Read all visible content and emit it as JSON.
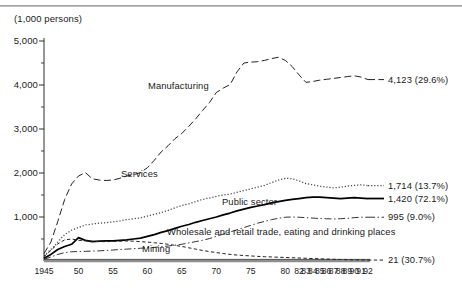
{
  "figure": {
    "unit_note": "(1,000 persons)"
  },
  "chart_data": {
    "type": "line",
    "title": "",
    "subtitle": "",
    "xlabel": "",
    "ylabel": "(1,000 persons)",
    "ylim": [
      0,
      5000
    ],
    "xlim": [
      1945,
      1992
    ],
    "grid": false,
    "legend": "inline-annotations",
    "y_ticks": [
      {
        "value": 5000,
        "label": "5,000"
      },
      {
        "value": 4000,
        "label": "4,000"
      },
      {
        "value": 3000,
        "label": "3,000"
      },
      {
        "value": 2000,
        "label": "2,000"
      },
      {
        "value": 1000,
        "label": "1,000"
      }
    ],
    "y_minor_ticks": [
      4500,
      3500,
      2500,
      1500,
      500
    ],
    "x_ticks": [
      {
        "value": 1945,
        "label": "1945"
      },
      {
        "value": 1950,
        "label": "50"
      },
      {
        "value": 1955,
        "label": "55"
      },
      {
        "value": 1960,
        "label": "60"
      },
      {
        "value": 1965,
        "label": "65"
      },
      {
        "value": 1970,
        "label": "70"
      },
      {
        "value": 1975,
        "label": "75"
      },
      {
        "value": 1980,
        "label": "80"
      },
      {
        "value": 1982,
        "label": "82"
      },
      {
        "value": 1983,
        "label": "83"
      },
      {
        "value": 1984,
        "label": "84"
      },
      {
        "value": 1985,
        "label": "85"
      },
      {
        "value": 1986,
        "label": "86"
      },
      {
        "value": 1987,
        "label": "87"
      },
      {
        "value": 1988,
        "label": "88"
      },
      {
        "value": 1989,
        "label": "89"
      },
      {
        "value": 1990,
        "label": "90"
      },
      {
        "value": 1991,
        "label": "91"
      },
      {
        "value": 1992,
        "label": "92"
      }
    ],
    "series": [
      {
        "name": "Manufacturing",
        "label": "Manufacturing",
        "end_label": "4,123 (29.6%)",
        "end_value": 4123,
        "end_percent": "29.6%",
        "style": "dashed",
        "color": "#222222",
        "x": [
          1945,
          1946,
          1947,
          1948,
          1949,
          1950,
          1951,
          1952,
          1953,
          1954,
          1955,
          1956,
          1957,
          1958,
          1959,
          1960,
          1961,
          1962,
          1963,
          1964,
          1965,
          1966,
          1967,
          1968,
          1969,
          1970,
          1971,
          1972,
          1973,
          1974,
          1975,
          1976,
          1977,
          1978,
          1979,
          1980,
          1981,
          1982,
          1983,
          1984,
          1985,
          1986,
          1987,
          1988,
          1989,
          1990,
          1991,
          1992
        ],
        "y": [
          170,
          430,
          900,
          1400,
          1750,
          1930,
          2010,
          1870,
          1840,
          1830,
          1840,
          1880,
          1930,
          1960,
          2010,
          2120,
          2290,
          2480,
          2620,
          2780,
          2900,
          3060,
          3230,
          3420,
          3600,
          3830,
          3930,
          4010,
          4300,
          4500,
          4520,
          4530,
          4560,
          4600,
          4630,
          4560,
          4420,
          4230,
          4060,
          4080,
          4110,
          4130,
          4150,
          4170,
          4190,
          4210,
          4180,
          4123
        ]
      },
      {
        "name": "Services",
        "label": "Services",
        "end_label": "1,714 (13.7%)",
        "end_value": 1714,
        "end_percent": "13.7%",
        "style": "dotted",
        "color": "#444444",
        "x": [
          1945,
          1946,
          1947,
          1948,
          1949,
          1950,
          1951,
          1952,
          1953,
          1954,
          1955,
          1956,
          1957,
          1958,
          1959,
          1960,
          1961,
          1962,
          1963,
          1964,
          1965,
          1966,
          1967,
          1968,
          1969,
          1970,
          1971,
          1972,
          1973,
          1974,
          1975,
          1976,
          1977,
          1978,
          1979,
          1980,
          1981,
          1982,
          1983,
          1984,
          1985,
          1986,
          1987,
          1988,
          1989,
          1990,
          1991,
          1992
        ],
        "y": [
          120,
          260,
          430,
          600,
          700,
          760,
          820,
          840,
          860,
          870,
          890,
          910,
          940,
          960,
          980,
          1020,
          1060,
          1100,
          1150,
          1210,
          1260,
          1300,
          1350,
          1400,
          1430,
          1470,
          1500,
          1520,
          1560,
          1600,
          1640,
          1680,
          1720,
          1780,
          1840,
          1880,
          1870,
          1820,
          1760,
          1730,
          1700,
          1680,
          1660,
          1680,
          1700,
          1720,
          1730,
          1714
        ]
      },
      {
        "name": "Public sector",
        "label": "Public sector",
        "end_label": "1,420 (72.1%)",
        "end_value": 1420,
        "end_percent": "72.1%",
        "style": "solid",
        "color": "#000000",
        "x": [
          1945,
          1946,
          1947,
          1948,
          1949,
          1950,
          1951,
          1952,
          1953,
          1954,
          1955,
          1956,
          1957,
          1958,
          1959,
          1960,
          1961,
          1962,
          1963,
          1964,
          1965,
          1966,
          1967,
          1968,
          1969,
          1970,
          1971,
          1972,
          1973,
          1974,
          1975,
          1976,
          1977,
          1978,
          1979,
          1980,
          1981,
          1982,
          1983,
          1984,
          1985,
          1986,
          1987,
          1988,
          1989,
          1990,
          1991,
          1992
        ],
        "y": [
          60,
          150,
          260,
          330,
          380,
          530,
          470,
          440,
          450,
          460,
          460,
          470,
          480,
          500,
          520,
          560,
          600,
          650,
          690,
          740,
          790,
          830,
          880,
          920,
          960,
          1000,
          1050,
          1090,
          1140,
          1180,
          1220,
          1250,
          1280,
          1320,
          1350,
          1380,
          1400,
          1420,
          1440,
          1450,
          1450,
          1440,
          1430,
          1420,
          1430,
          1440,
          1430,
          1420
        ]
      },
      {
        "name": "Wholesale and retail trade, eating and drinking places",
        "label": "Wholesale and retail trade, eating and drinking places",
        "end_label": "995 (9.0%)",
        "end_value": 995,
        "end_percent": "9.0%",
        "style": "dash-dot",
        "color": "#333333",
        "x": [
          1945,
          1946,
          1947,
          1948,
          1949,
          1950,
          1951,
          1952,
          1953,
          1954,
          1955,
          1956,
          1957,
          1958,
          1959,
          1960,
          1961,
          1962,
          1963,
          1964,
          1965,
          1966,
          1967,
          1968,
          1969,
          1970,
          1971,
          1972,
          1973,
          1974,
          1975,
          1976,
          1977,
          1978,
          1979,
          1980,
          1981,
          1982,
          1983,
          1984,
          1985,
          1986,
          1987,
          1988,
          1989,
          1990,
          1991,
          1992
        ],
        "y": [
          40,
          90,
          150,
          190,
          210,
          215,
          220,
          225,
          230,
          240,
          250,
          260,
          270,
          280,
          290,
          300,
          310,
          325,
          340,
          360,
          380,
          410,
          440,
          470,
          510,
          560,
          610,
          660,
          710,
          760,
          810,
          860,
          900,
          940,
          970,
          995,
          1000,
          995,
          985,
          975,
          965,
          960,
          955,
          960,
          970,
          985,
          995,
          995
        ]
      },
      {
        "name": "Mining",
        "label": "Mining",
        "end_label": "21 (30.7%)",
        "end_value": 21,
        "end_percent": "30.7%",
        "style": "short-dash",
        "color": "#222222",
        "x": [
          1945,
          1946,
          1947,
          1948,
          1949,
          1950,
          1951,
          1952,
          1953,
          1954,
          1955,
          1956,
          1957,
          1958,
          1959,
          1960,
          1961,
          1962,
          1963,
          1964,
          1965,
          1966,
          1967,
          1968,
          1969,
          1970,
          1971,
          1972,
          1973,
          1974,
          1975,
          1976,
          1977,
          1978,
          1979,
          1980,
          1981,
          1982,
          1983,
          1984,
          1985,
          1986,
          1987,
          1988,
          1989,
          1990,
          1991,
          1992
        ],
        "y": [
          100,
          240,
          390,
          480,
          500,
          470,
          460,
          450,
          440,
          440,
          445,
          450,
          455,
          450,
          440,
          430,
          415,
          400,
          380,
          355,
          330,
          300,
          270,
          240,
          215,
          190,
          170,
          150,
          135,
          125,
          115,
          105,
          98,
          92,
          86,
          80,
          74,
          68,
          62,
          56,
          50,
          44,
          39,
          34,
          30,
          26,
          23,
          21
        ]
      }
    ]
  },
  "annotations": {
    "manufacturing": "Manufacturing",
    "services": "Services",
    "public_sector": "Public sector",
    "wholesale": "Wholesale and retail trade, eating and drinking places",
    "mining": "Mining"
  }
}
